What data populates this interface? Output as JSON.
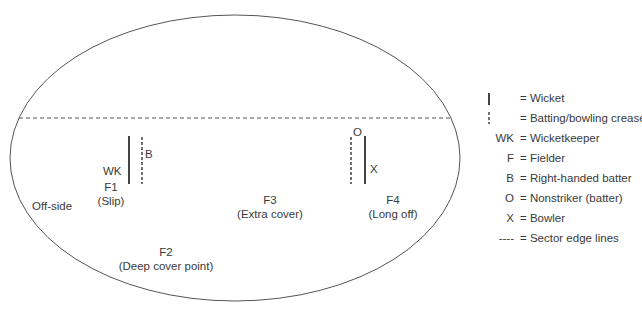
{
  "field": {
    "side_label": "Off-side",
    "wk": "WK",
    "batter": "B",
    "nonstriker": "O",
    "bowler": "X",
    "fielders": [
      {
        "id": "F1",
        "name": "(Slip)"
      },
      {
        "id": "F2",
        "name": "(Deep cover point)"
      },
      {
        "id": "F3",
        "name": "(Extra cover)"
      },
      {
        "id": "F4",
        "name": "(Long off)"
      }
    ]
  },
  "legend": [
    {
      "symbol": "",
      "text": "= Wicket"
    },
    {
      "symbol": "",
      "text": "= Batting/bowling crease"
    },
    {
      "symbol": "WK",
      "text": "= Wicketkeeper"
    },
    {
      "symbol": "F",
      "text": "= Fielder"
    },
    {
      "symbol": "B",
      "text": "= Right-handed batter"
    },
    {
      "symbol": "O",
      "text": "= Nonstriker (batter)"
    },
    {
      "symbol": "X",
      "text": "= Bowler"
    },
    {
      "symbol": "----",
      "text": "= Sector edge lines"
    }
  ]
}
